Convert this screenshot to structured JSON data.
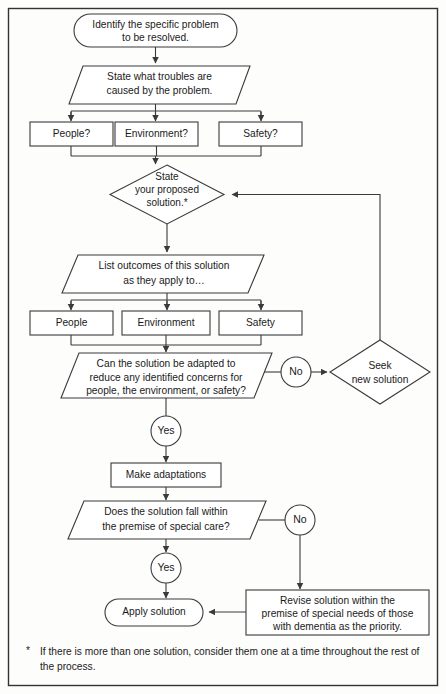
{
  "diagram": {
    "nodes": {
      "start": {
        "line1": "Identify the specific problem",
        "line2": "to be resolved."
      },
      "troubles": {
        "line1": "State what troubles are",
        "line2": "caused by the problem."
      },
      "q_people": "People?",
      "q_environment": "Environment?",
      "q_safety": "Safety?",
      "propose": {
        "line1": "State",
        "line2": "your proposed",
        "line3": "solution.*"
      },
      "outcomes": {
        "line1": "List outcomes of this solution",
        "line2": "as they apply to…"
      },
      "o_people": "People",
      "o_environment": "Environment",
      "o_safety": "Safety",
      "adapt_question": {
        "line1": "Can the solution be adapted to",
        "line2": "reduce any identified concerns for",
        "line3": "people, the environment, or safety?"
      },
      "seek": {
        "line1": "Seek",
        "line2": "new solution"
      },
      "make_adaptations": "Make adaptations",
      "premise_question": {
        "line1": "Does the solution fall within",
        "line2": "the premise of special care?"
      },
      "revise": {
        "line1": "Revise solution within the",
        "line2": "premise of special needs of those",
        "line3": "with dementia as the priority."
      },
      "apply": "Apply solution"
    },
    "edge_labels": {
      "yes_adapt": "Yes",
      "no_adapt": "No",
      "yes_premise": "Yes",
      "no_premise": "No"
    },
    "footnote": {
      "marker": "*",
      "text": "If there is more than one solution, consider them one at a time throughout the rest of the process."
    },
    "colors": {
      "stroke": "#3a3a3a",
      "frame": "#333333",
      "fill": "#ffffff",
      "text": "#1a1a1a",
      "background": "#fdfdfc"
    }
  }
}
